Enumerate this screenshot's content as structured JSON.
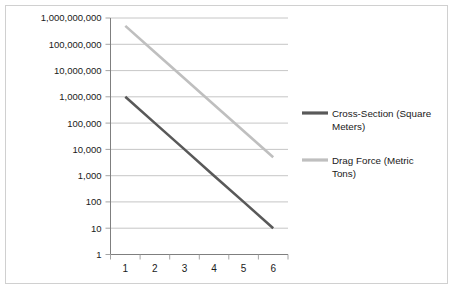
{
  "chart_data": {
    "type": "line",
    "title": "",
    "xlabel": "",
    "ylabel": "",
    "yscale": "log",
    "ylim": [
      1,
      1000000000
    ],
    "xlim": [
      1,
      6
    ],
    "grid": true,
    "legend_position": "right",
    "x": [
      1,
      2,
      3,
      4,
      5,
      6
    ],
    "xtick_labels": [
      "1",
      "2",
      "3",
      "4",
      "5",
      "6"
    ],
    "ytick_labels": [
      "1,000,000,000",
      "100,000,000",
      "10,000,000",
      "1,000,000",
      "100,000",
      "10,000",
      "1,000",
      "100",
      "10",
      "1"
    ],
    "ytick_values": [
      1000000000,
      100000000,
      10000000,
      1000000,
      100000,
      10000,
      1000,
      100,
      10,
      1
    ],
    "series": [
      {
        "name": "Cross-Section (Square Meters)",
        "color": "#595959",
        "values": [
          1000000,
          100000,
          10000,
          1000,
          100,
          10
        ]
      },
      {
        "name": "Drag Force (Metric Tons)",
        "color": "#bfbfbf",
        "values": [
          500000000,
          50000000,
          5000000,
          500000,
          50000,
          5000
        ]
      }
    ]
  },
  "legend": {
    "entries": [
      {
        "label_line1": "Cross-Section (Square",
        "label_line2": "Meters)",
        "color": "#595959"
      },
      {
        "label_line1": "Drag Force (Metric",
        "label_line2": "Tons)",
        "color": "#bfbfbf"
      }
    ]
  },
  "colors": {
    "frame_border": "#d0d0d0",
    "gridline": "#b8b8b8",
    "axis": "#7f7f7f",
    "text": "#1a1a1a",
    "background": "#ffffff"
  }
}
